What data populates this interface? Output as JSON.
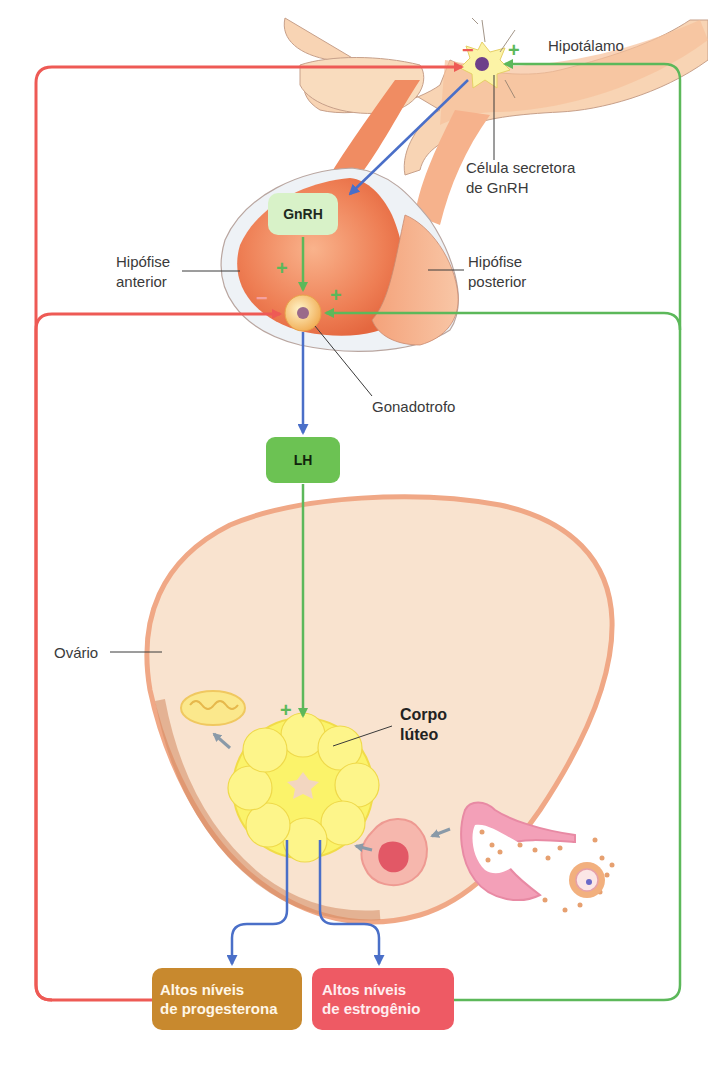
{
  "labels": {
    "hypothalamus": "Hipotálamo",
    "gnrh_cell_line1": "Célula secretora",
    "gnrh_cell_line2": "de GnRH",
    "anterior_pituitary_line1": "Hipófise",
    "anterior_pituitary_line2": "anterior",
    "posterior_pituitary_line1": "Hipófise",
    "posterior_pituitary_line2": "posterior",
    "gonadotroph": "Gonadotrofo",
    "ovary": "Ovário",
    "corpus_luteum_line1": "Corpo",
    "corpus_luteum_line2": "lúteo"
  },
  "boxes": {
    "gnrh": "GnRH",
    "lh": "LH",
    "progesterone_line1": "Altos níveis",
    "progesterone_line2": "de progesterona",
    "estrogen_line1": "Altos níveis",
    "estrogen_line2": "de estrogênio"
  },
  "signs": {
    "hypothalamus_minus": "−",
    "hypothalamus_plus": "+",
    "gnrh_plus": "+",
    "gonadotroph_minus": "−",
    "gonadotroph_plus": "+",
    "lh_plus": "+"
  },
  "colors": {
    "inhibition_red": "#ee5a55",
    "stimulation_green": "#5cb85a",
    "secretion_blue": "#4a6fc8",
    "gnrh_box": "#d8f2c8",
    "lh_box": "#6cc253",
    "progesterone_box": "#c8892e",
    "estrogen_box": "#ee5a64"
  }
}
